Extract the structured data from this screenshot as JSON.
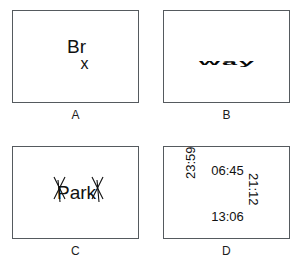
{
  "figure": {
    "background_color": "#ffffff",
    "text_color": "#111111",
    "border_color": "#555a5e",
    "layout": "2x2 grid of bordered panels"
  },
  "panels": [
    {
      "label": "A",
      "distortion": "word-split-two-lines",
      "line_top": "Br",
      "line_bottom": "x",
      "full_text": "Brx"
    },
    {
      "label": "B",
      "distortion": "vertical-squash",
      "word": "way"
    },
    {
      "label": "C",
      "distortion": "x-strokes-overlay",
      "word": "Park"
    },
    {
      "label": "D",
      "distortion": "radial-rotation",
      "items": [
        {
          "text": "06:45",
          "position": "top",
          "rotation": 0
        },
        {
          "text": "21:12",
          "position": "right",
          "rotation": 90
        },
        {
          "text": "13:06",
          "position": "bottom",
          "rotation": 0
        },
        {
          "text": "23:59",
          "position": "left",
          "rotation": -90
        }
      ]
    }
  ]
}
